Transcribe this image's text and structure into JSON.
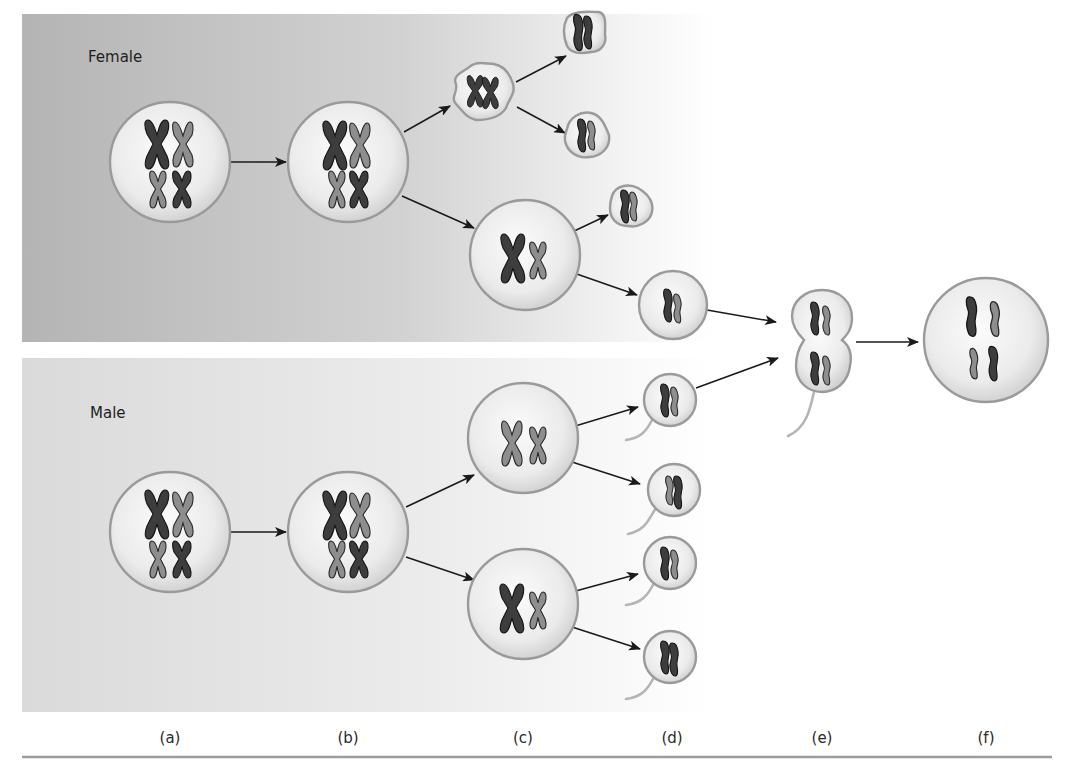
{
  "figure": {
    "panels": {
      "female": {
        "label": "Female"
      },
      "male": {
        "label": "Male"
      }
    },
    "stage_labels": [
      {
        "id": "a",
        "text": "(a)",
        "x": 170
      },
      {
        "id": "b",
        "text": "(b)",
        "x": 348
      },
      {
        "id": "c",
        "text": "(c)",
        "x": 523
      },
      {
        "id": "d",
        "text": "(d)",
        "x": 672
      },
      {
        "id": "e",
        "text": "(e)",
        "x": 822
      },
      {
        "id": "f",
        "text": "(f)",
        "x": 986
      }
    ],
    "colors": {
      "panel_gray": "#b9b9b9",
      "panel_light": "#dcdcdc",
      "cell_fill_center": "#fafafa",
      "cell_fill_edge": "#d4d4d4",
      "cell_outline": "#9a9a9a",
      "chromosome_dark": "#3d3d3d",
      "chromosome_light": "#8e8e8e",
      "arrow": "#1a1a1a",
      "rule": "#9c9c9c"
    },
    "female_cells": [
      {
        "name": "oogonium",
        "stage": "a",
        "x": 170,
        "y": 162,
        "r": 60,
        "shape": "circle",
        "chromosomes": "4-x"
      },
      {
        "name": "primary-oocyte",
        "stage": "b",
        "x": 348,
        "y": 162,
        "r": 60,
        "shape": "circle",
        "chromosomes": "4-x"
      },
      {
        "name": "first-polar-body",
        "stage": "c",
        "x": 482,
        "y": 90,
        "r": 32,
        "shape": "irregular",
        "chromosomes": "2-x"
      },
      {
        "name": "secondary-oocyte",
        "stage": "c",
        "x": 525,
        "y": 255,
        "r": 55,
        "shape": "circle",
        "chromosomes": "2-x"
      },
      {
        "name": "polar-body-1",
        "stage": "d",
        "x": 585,
        "y": 30,
        "r": 20,
        "shape": "irregular",
        "chromosomes": "2-single"
      },
      {
        "name": "polar-body-2",
        "stage": "d",
        "x": 587,
        "y": 135,
        "r": 22,
        "shape": "irregular",
        "chromosomes": "2-single"
      },
      {
        "name": "polar-body-3",
        "stage": "d",
        "x": 630,
        "y": 205,
        "r": 21,
        "shape": "irregular",
        "chromosomes": "2-single"
      },
      {
        "name": "ovum",
        "stage": "d",
        "x": 673,
        "y": 305,
        "r": 34,
        "shape": "circle",
        "chromosomes": "2-single"
      }
    ],
    "male_cells": [
      {
        "name": "spermatogonium",
        "stage": "a",
        "x": 170,
        "y": 532,
        "r": 60,
        "shape": "circle",
        "chromosomes": "4-x"
      },
      {
        "name": "primary-spermatocyte",
        "stage": "b",
        "x": 348,
        "y": 532,
        "r": 60,
        "shape": "circle",
        "chromosomes": "4-x"
      },
      {
        "name": "secondary-spermatocyte-1",
        "stage": "c",
        "x": 523,
        "y": 438,
        "r": 55,
        "shape": "circle",
        "chromosomes": "2-x"
      },
      {
        "name": "secondary-spermatocyte-2",
        "stage": "c",
        "x": 523,
        "y": 604,
        "r": 55,
        "shape": "circle",
        "chromosomes": "2-x"
      },
      {
        "name": "sperm-1",
        "stage": "d",
        "x": 670,
        "y": 400,
        "r": 26,
        "shape": "sperm",
        "chromosomes": "2-single"
      },
      {
        "name": "sperm-2",
        "stage": "d",
        "x": 674,
        "y": 490,
        "r": 26,
        "shape": "sperm",
        "chromosomes": "2-single"
      },
      {
        "name": "sperm-3",
        "stage": "d",
        "x": 670,
        "y": 563,
        "r": 26,
        "shape": "sperm",
        "chromosomes": "2-single"
      },
      {
        "name": "sperm-4",
        "stage": "d",
        "x": 670,
        "y": 657,
        "r": 26,
        "shape": "sperm",
        "chromosomes": "2-single"
      }
    ],
    "fusion_cells": [
      {
        "name": "fertilization",
        "stage": "e",
        "x": 822,
        "y": 335,
        "shape": "fusing"
      },
      {
        "name": "zygote",
        "stage": "f",
        "x": 986,
        "y": 340,
        "r": 62,
        "shape": "circle",
        "chromosomes": "4-single"
      }
    ]
  }
}
